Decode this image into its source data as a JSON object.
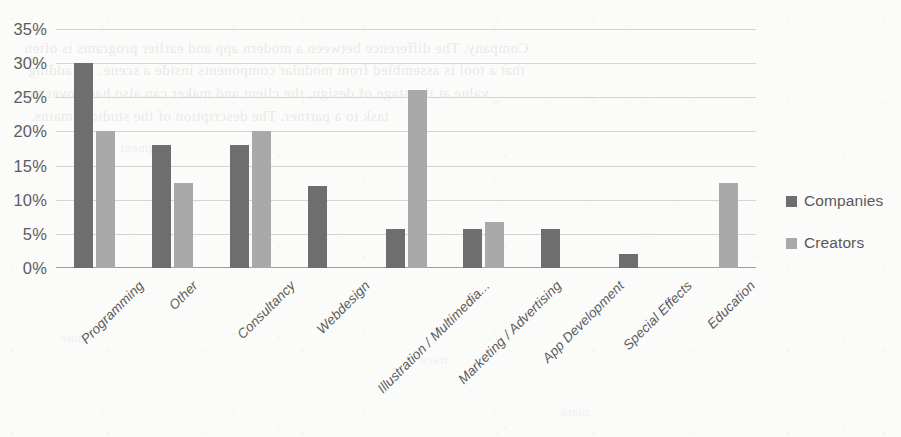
{
  "chart_data": {
    "type": "bar",
    "title": "",
    "xlabel": "",
    "ylabel": "",
    "ylim": [
      0,
      35
    ],
    "ytick_step": 5,
    "ytick_labels": [
      "35%",
      "30%",
      "25%",
      "20%",
      "15%",
      "10%",
      "5%",
      "0%"
    ],
    "ytick_values": [
      35,
      30,
      25,
      20,
      15,
      10,
      5,
      0
    ],
    "grid": true,
    "legend_position": "right",
    "unit": "%",
    "categories": [
      "Programming",
      "Other",
      "Consultancy",
      "Webdesign",
      "Illustration / Multimedia...",
      "Marketing / Advertising",
      "App Development",
      "Special Effects",
      "Education"
    ],
    "series": [
      {
        "name": "Companies",
        "color": "#6e6e6e",
        "values": [
          30,
          18,
          18,
          12,
          5.7,
          5.7,
          5.7,
          2,
          0
        ]
      },
      {
        "name": "Creators",
        "color": "#a9a9a9",
        "values": [
          20,
          12.5,
          20,
          0,
          26,
          6.8,
          0,
          0,
          12.5
        ]
      }
    ]
  },
  "legend": {
    "items": [
      {
        "label": "Companies",
        "swatch": "companies"
      },
      {
        "label": "Creators",
        "swatch": "creators"
      }
    ]
  },
  "background_bleed": {
    "lines": [
      "Company. The difference between a modern app and earlier programs is often",
      "that a tool is assembled from modular components inside a scene. By adding",
      "value at the stage of design, the client and maker can also hand over the",
      "task to a partner. The description of the studio remains."
    ],
    "marks": [
      "fragment",
      "note",
      "trace",
      "mark"
    ]
  }
}
